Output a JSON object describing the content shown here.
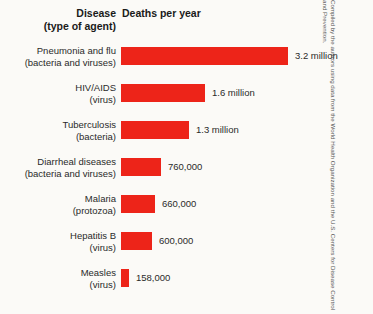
{
  "header": {
    "disease_line1": "Disease",
    "disease_line2": "(type of agent)",
    "deaths": "Deaths per year"
  },
  "credit": "Compiled by the authors using data from the World Health Organization and the U.S. Centers for Disease Control and Prevention.",
  "colors": {
    "bar": "#ed2419",
    "background": "#fbfaf7",
    "text": "#2a2a2a"
  },
  "chart_data": {
    "type": "bar",
    "title": "Deaths per year",
    "xlabel": "Deaths per year",
    "ylabel": "Disease (type of agent)",
    "orientation": "horizontal",
    "grid": false,
    "legend": false,
    "xlim": [
      0,
      3200000
    ],
    "categories": [
      "Pneumonia and flu",
      "HIV/AIDS",
      "Tuberculosis",
      "Diarrheal diseases",
      "Malaria",
      "Hepatitis B",
      "Measles"
    ],
    "agents": [
      "(bacteria and viruses)",
      "(virus)",
      "(bacteria)",
      "(bacteria and viruses)",
      "(protozoa)",
      "(virus)",
      "(virus)"
    ],
    "values": [
      3200000,
      1600000,
      1300000,
      760000,
      660000,
      600000,
      158000
    ],
    "value_labels": [
      "3.2 million",
      "1.6 million",
      "1.3 million",
      "760,000",
      "660,000",
      "600,000",
      "158,000"
    ],
    "bar_widths_px": [
      167,
      84,
      68,
      40,
      34,
      31,
      8
    ]
  }
}
